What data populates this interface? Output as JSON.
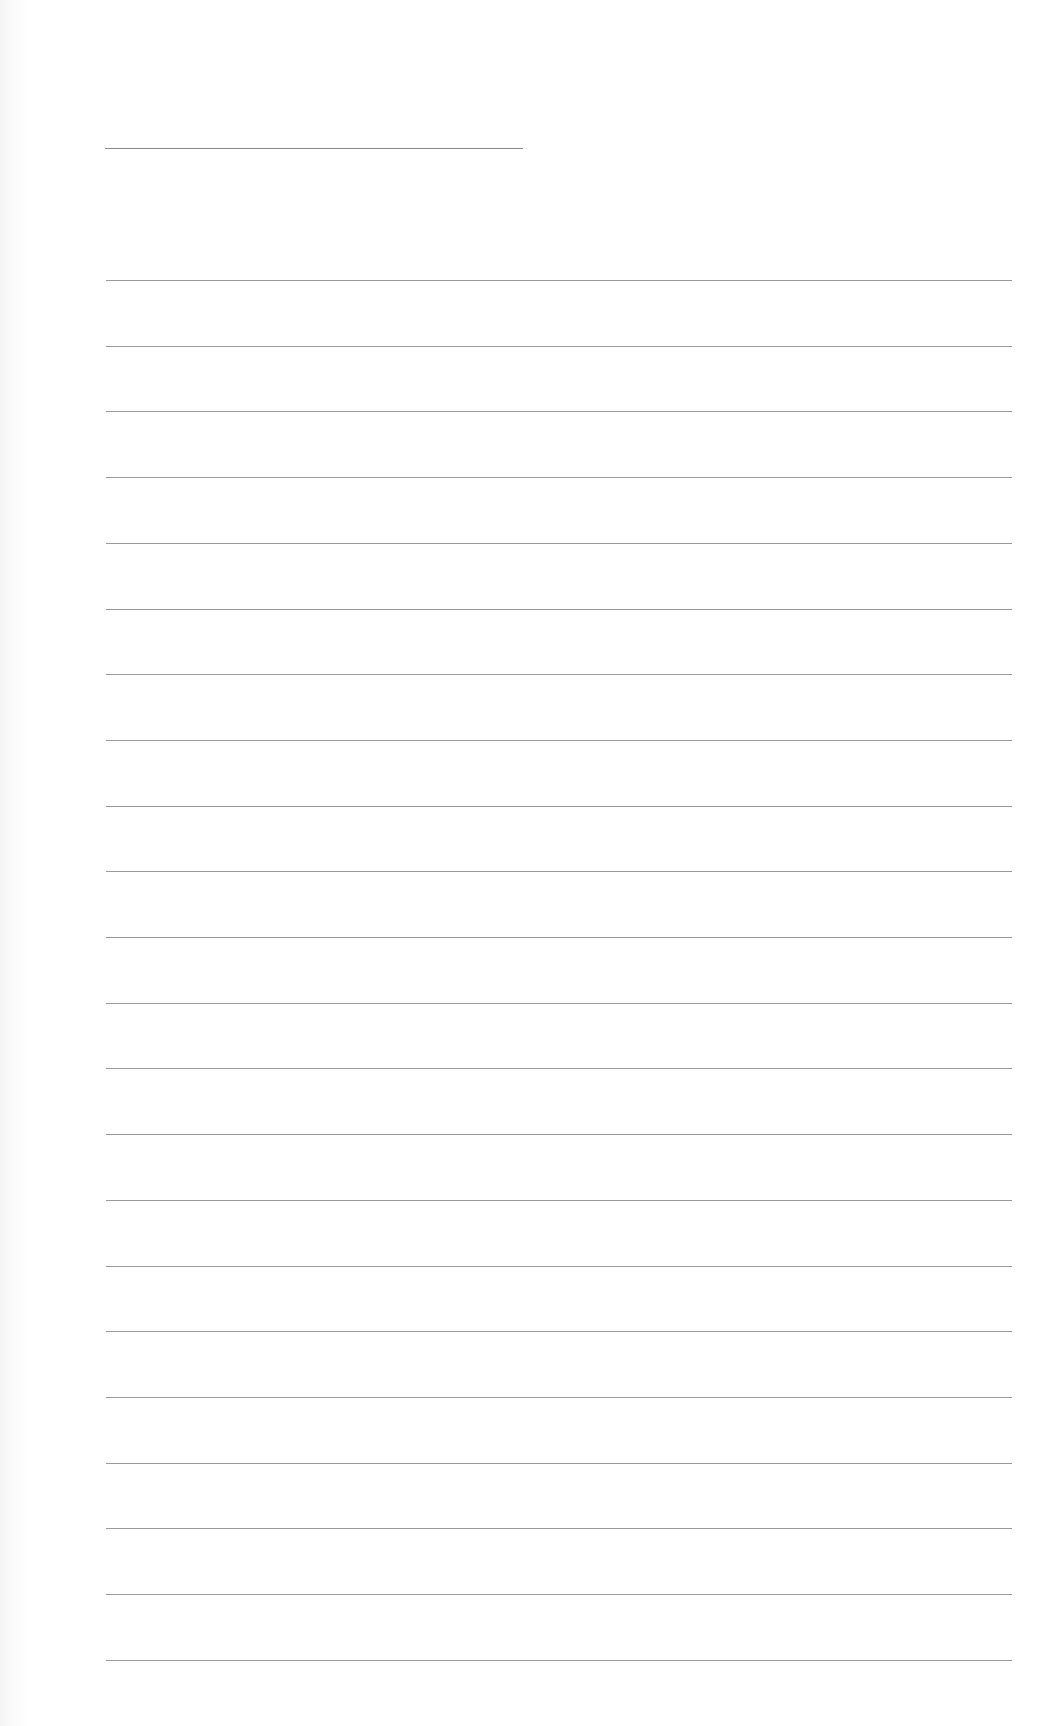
{
  "page": {
    "type": "blank ruled writing sheet",
    "background_color": "#ffffff",
    "line_color": "#9a9a9a",
    "title_line": {
      "x": 105,
      "y": 148,
      "width": 418
    },
    "ruled_lines": {
      "count": 22,
      "x": 106,
      "width": 906,
      "first_y": 280,
      "spacing": 65.7
    },
    "text_content": ""
  }
}
